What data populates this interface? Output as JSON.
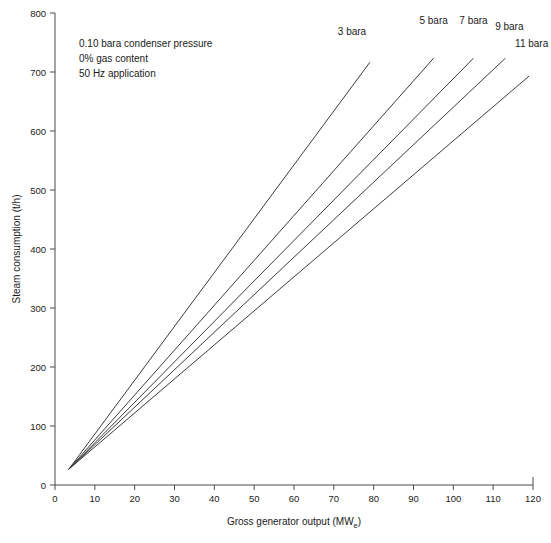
{
  "chart_data": {
    "type": "line",
    "title": "",
    "xlabel": "Gross generator output (MW",
    "xlabel_sub": "e",
    "xlabel_close": ")",
    "ylabel": "Steam consumption (t/h)",
    "xlim": [
      0,
      120
    ],
    "ylim": [
      0,
      800
    ],
    "xticks": [
      0,
      10,
      20,
      30,
      40,
      50,
      60,
      70,
      80,
      90,
      100,
      110,
      120
    ],
    "yticks": [
      0,
      100,
      200,
      300,
      400,
      500,
      600,
      700,
      800
    ],
    "grid": false,
    "legend_position": "inline-end-of-line",
    "line_color": "#3c3c3c",
    "axis_color": "#4a4a4a",
    "annotations": [
      "0.10 bara condenser pressure",
      "0% gas content",
      "50 Hz  application"
    ],
    "series": [
      {
        "name": "3 bara",
        "label": "3 bara",
        "x": [
          3.5,
          79.0
        ],
        "y": [
          27,
          716
        ]
      },
      {
        "name": "5 bara",
        "label": "5 bara",
        "x": [
          3.5,
          95.0
        ],
        "y": [
          27,
          723
        ]
      },
      {
        "name": "7 bara",
        "label": "7 bara",
        "x": [
          3.5,
          105.0
        ],
        "y": [
          27,
          723
        ]
      },
      {
        "name": "9 bara",
        "label": "9 bara",
        "x": [
          3.5,
          113.0
        ],
        "y": [
          27,
          723
        ]
      },
      {
        "name": "11 bara",
        "label": "11 bara",
        "x": [
          3.5,
          119.0
        ],
        "y": [
          27,
          693
        ]
      }
    ],
    "series_label_positions": [
      {
        "label": "3 bara",
        "x": 71.0,
        "y": 762
      },
      {
        "label": "5 bara",
        "x": 91.5,
        "y": 782
      },
      {
        "label": "7 bara",
        "x": 101.5,
        "y": 782
      },
      {
        "label": "9 bara",
        "x": 110.5,
        "y": 772
      },
      {
        "label": "11 bara",
        "x": 115.5,
        "y": 742
      }
    ]
  }
}
